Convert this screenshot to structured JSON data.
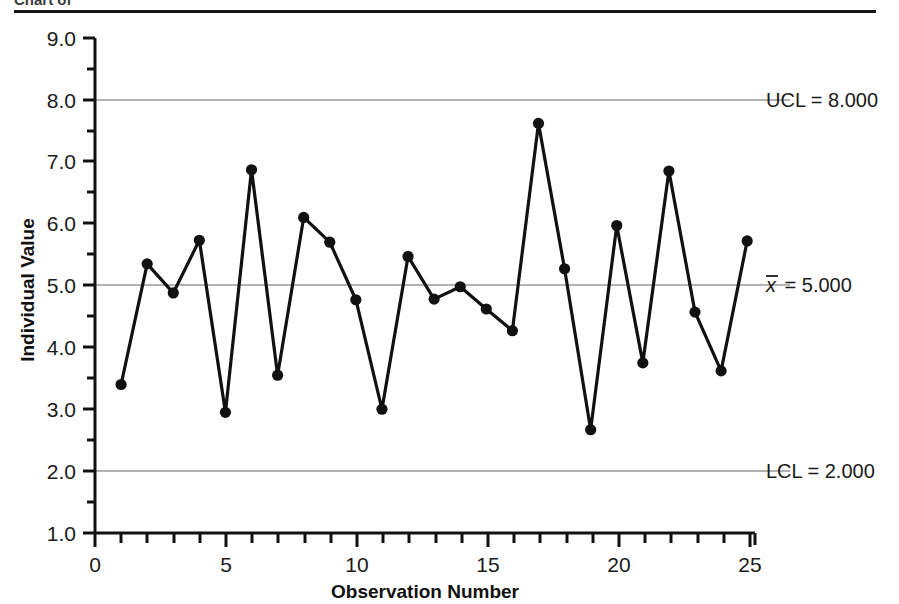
{
  "figure": {
    "title_partial": "Chart of",
    "background": "#ffffff",
    "line_color": "#111111",
    "marker_color": "#111111",
    "gridline_color": "#b3b3b3",
    "axis_color": "#111111"
  },
  "chart_data": {
    "type": "line",
    "title": "",
    "xlabel": "Observation Number",
    "ylabel": "Individual Value",
    "xlim": [
      0,
      25.3
    ],
    "ylim": [
      1.0,
      9.0
    ],
    "xticks": [
      0,
      5,
      10,
      15,
      20,
      25
    ],
    "xtick_labels": [
      "0",
      "5",
      "10",
      "15",
      "20",
      "25"
    ],
    "x_minor_tick_step": 1,
    "yticks": [
      1.0,
      2.0,
      3.0,
      4.0,
      5.0,
      6.0,
      7.0,
      8.0,
      9.0
    ],
    "ytick_labels": [
      "1.0",
      "2.0",
      "3.0",
      "4.0",
      "5.0",
      "6.0",
      "7.0",
      "8.0",
      "9.0"
    ],
    "y_minor_tick_step": 0.5,
    "grid": "horizontal-control-limits-only",
    "legend": "none",
    "x": [
      1,
      2,
      3,
      4,
      5,
      6,
      7,
      8,
      9,
      10,
      11,
      12,
      13,
      14,
      15,
      16,
      17,
      18,
      19,
      20,
      21,
      22,
      23,
      24,
      25
    ],
    "values": [
      3.4,
      5.35,
      4.88,
      5.73,
      2.95,
      6.87,
      3.55,
      6.1,
      5.7,
      4.77,
      3.0,
      5.47,
      4.78,
      4.98,
      4.62,
      4.27,
      7.62,
      5.27,
      2.67,
      5.97,
      3.75,
      6.85,
      4.57,
      3.62,
      5.72
    ],
    "control_lines": [
      {
        "name": "UCL",
        "label": "UCL = 8.000",
        "value": 8.0,
        "prefix": "UCL",
        "number": "8.000"
      },
      {
        "name": "center",
        "label": "x̄ = 5.000",
        "value": 5.0,
        "prefix": "x̄",
        "number": "5.000"
      },
      {
        "name": "LCL",
        "label": "LCL = 2.000",
        "value": 2.0,
        "prefix": "LCL",
        "number": "2.000"
      }
    ]
  },
  "labels": {
    "ucl": "UCL = 8.000",
    "ucl_value": "8.000",
    "center_value": "5.000",
    "lcl": "LCL = 2.000",
    "lcl_value": "2.000",
    "xbar_symbol": "x",
    "equals": "=",
    "x_axis_title": "Observation Number",
    "y_axis_title": "Individual Value"
  }
}
